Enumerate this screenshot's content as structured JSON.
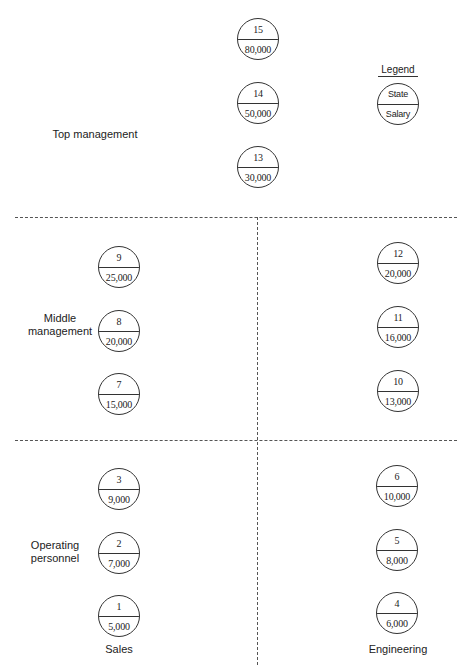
{
  "legend": {
    "title": "Legend",
    "top_label": "State",
    "bottom_label": "Salary"
  },
  "levels": {
    "top": "Top management",
    "middle": "Middle management",
    "operating": "Operating personnel"
  },
  "columns": {
    "sales": "Sales",
    "engineering": "Engineering"
  },
  "nodes": {
    "n15": {
      "state": "15",
      "salary": "80,000"
    },
    "n14": {
      "state": "14",
      "salary": "50,000"
    },
    "n13": {
      "state": "13",
      "salary": "30,000"
    },
    "n9": {
      "state": "9",
      "salary": "25,000"
    },
    "n8": {
      "state": "8",
      "salary": "20,000"
    },
    "n7": {
      "state": "7",
      "salary": "15,000"
    },
    "n12": {
      "state": "12",
      "salary": "20,000"
    },
    "n11": {
      "state": "11",
      "salary": "16,000"
    },
    "n10": {
      "state": "10",
      "salary": "13,000"
    },
    "n3": {
      "state": "3",
      "salary": "9,000"
    },
    "n2": {
      "state": "2",
      "salary": "7,000"
    },
    "n1": {
      "state": "1",
      "salary": "5,000"
    },
    "n6": {
      "state": "6",
      "salary": "10,000"
    },
    "n5": {
      "state": "5",
      "salary": "8,000"
    },
    "n4": {
      "state": "4",
      "salary": "6,000"
    }
  }
}
